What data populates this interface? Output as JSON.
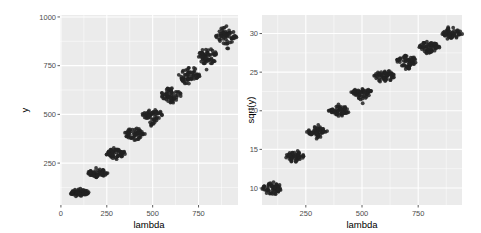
{
  "chart_data": [
    {
      "type": "scatter",
      "title": "",
      "xlabel": "lambda",
      "ylabel": "y",
      "xlim": [
        -5,
        965
      ],
      "ylim": [
        35,
        1010
      ],
      "xticks": [
        0,
        250,
        500,
        750
      ],
      "xtick_labels": [
        "0",
        "250",
        "500",
        "750"
      ],
      "yticks": [
        250,
        500,
        750,
        1000
      ],
      "ytick_labels": [
        "250",
        "500",
        "750",
        "1000"
      ],
      "grid": true,
      "legend": "none",
      "groups": [
        {
          "x": 100,
          "center": 100,
          "min": 75,
          "max": 128
        },
        {
          "x": 200,
          "center": 200,
          "min": 170,
          "max": 232
        },
        {
          "x": 300,
          "center": 300,
          "min": 262,
          "max": 340
        },
        {
          "x": 400,
          "center": 400,
          "min": 355,
          "max": 440
        },
        {
          "x": 500,
          "center": 500,
          "min": 430,
          "max": 530
        },
        {
          "x": 600,
          "center": 600,
          "min": 545,
          "max": 655
        },
        {
          "x": 700,
          "center": 700,
          "min": 625,
          "max": 760
        },
        {
          "x": 800,
          "center": 800,
          "min": 720,
          "max": 855
        },
        {
          "x": 900,
          "center": 900,
          "min": 830,
          "max": 970
        }
      ]
    },
    {
      "type": "scatter",
      "title": "",
      "xlabel": "lambda",
      "ylabel": "sqrt(y)",
      "xlim": [
        55,
        945
      ],
      "ylim": [
        7.8,
        32.4
      ],
      "xticks": [
        250,
        500,
        750
      ],
      "xtick_labels": [
        "250",
        "500",
        "750"
      ],
      "yticks": [
        10,
        15,
        20,
        25,
        30
      ],
      "ytick_labels": [
        "10",
        "15",
        "20",
        "25",
        "30"
      ],
      "grid": true,
      "legend": "none",
      "groups": [
        {
          "x": 100,
          "center": 10.0,
          "min": 8.7,
          "max": 11.1
        },
        {
          "x": 200,
          "center": 14.1,
          "min": 13.1,
          "max": 14.9
        },
        {
          "x": 300,
          "center": 17.3,
          "min": 16.3,
          "max": 18.4
        },
        {
          "x": 400,
          "center": 20.0,
          "min": 19.0,
          "max": 21.0
        },
        {
          "x": 500,
          "center": 22.4,
          "min": 20.9,
          "max": 23.0
        },
        {
          "x": 600,
          "center": 24.5,
          "min": 23.4,
          "max": 25.6
        },
        {
          "x": 700,
          "center": 26.5,
          "min": 25.1,
          "max": 27.5
        },
        {
          "x": 800,
          "center": 28.3,
          "min": 27.0,
          "max": 29.2
        },
        {
          "x": 900,
          "center": 30.0,
          "min": 28.9,
          "max": 31.2
        }
      ]
    }
  ],
  "colors": {
    "panel_bg": "#ebebeb",
    "grid_major": "#ffffff",
    "points": "#222222",
    "tick_text": "#4d4d4d",
    "axis_title": "#000000"
  }
}
